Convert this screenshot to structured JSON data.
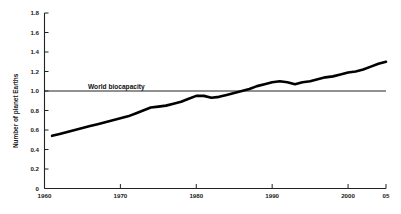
{
  "chart_data": {
    "type": "line",
    "title": "",
    "subtitle": "",
    "xlabel": "",
    "ylabel": "Number of planet Earths",
    "xlim": [
      1960,
      2005
    ],
    "ylim": [
      0,
      1.8
    ],
    "grid": false,
    "legend_position": "none",
    "x_tick_labels": [
      "1960",
      "1970",
      "1980",
      "1990",
      "2000",
      "05"
    ],
    "x_tick_values": [
      1960,
      1970,
      1980,
      1990,
      2000,
      2005
    ],
    "y_tick_labels": [
      "0",
      "0.2",
      "0.4",
      "0.6",
      "0.8",
      "1.0",
      "1.2",
      "1.4",
      "1.6",
      "1.8"
    ],
    "y_tick_values": [
      0,
      0.2,
      0.4,
      0.6,
      0.8,
      1.0,
      1.2,
      1.4,
      1.6,
      1.8
    ],
    "annotations": [
      {
        "text": "World biocapacity",
        "type": "reference-line-label",
        "value": 1.0,
        "x": 1971
      }
    ],
    "reference_lines": [
      {
        "name": "World biocapacity",
        "y": 1.0,
        "color": "#222222"
      }
    ],
    "series": [
      {
        "name": "Humanity's Ecological Footprint",
        "color": "#000000",
        "x": [
          1961,
          1962,
          1963,
          1964,
          1965,
          1966,
          1967,
          1968,
          1969,
          1970,
          1971,
          1972,
          1973,
          1974,
          1975,
          1976,
          1977,
          1978,
          1979,
          1980,
          1981,
          1982,
          1983,
          1984,
          1985,
          1986,
          1987,
          1988,
          1989,
          1990,
          1991,
          1992,
          1993,
          1994,
          1995,
          1996,
          1997,
          1998,
          1999,
          2000,
          2001,
          2002,
          2003,
          2004,
          2005
        ],
        "values": [
          0.54,
          0.56,
          0.58,
          0.6,
          0.62,
          0.64,
          0.66,
          0.68,
          0.7,
          0.72,
          0.74,
          0.77,
          0.8,
          0.83,
          0.84,
          0.85,
          0.87,
          0.89,
          0.92,
          0.95,
          0.95,
          0.93,
          0.94,
          0.96,
          0.98,
          1.0,
          1.02,
          1.05,
          1.07,
          1.09,
          1.1,
          1.09,
          1.07,
          1.09,
          1.1,
          1.12,
          1.14,
          1.15,
          1.17,
          1.19,
          1.2,
          1.22,
          1.25,
          1.28,
          1.3
        ]
      }
    ]
  },
  "colors": {
    "line": "#000000",
    "axis": "#222222",
    "biocapacity": "#333333",
    "background": "#ffffff",
    "text": "#1a1a1a"
  }
}
